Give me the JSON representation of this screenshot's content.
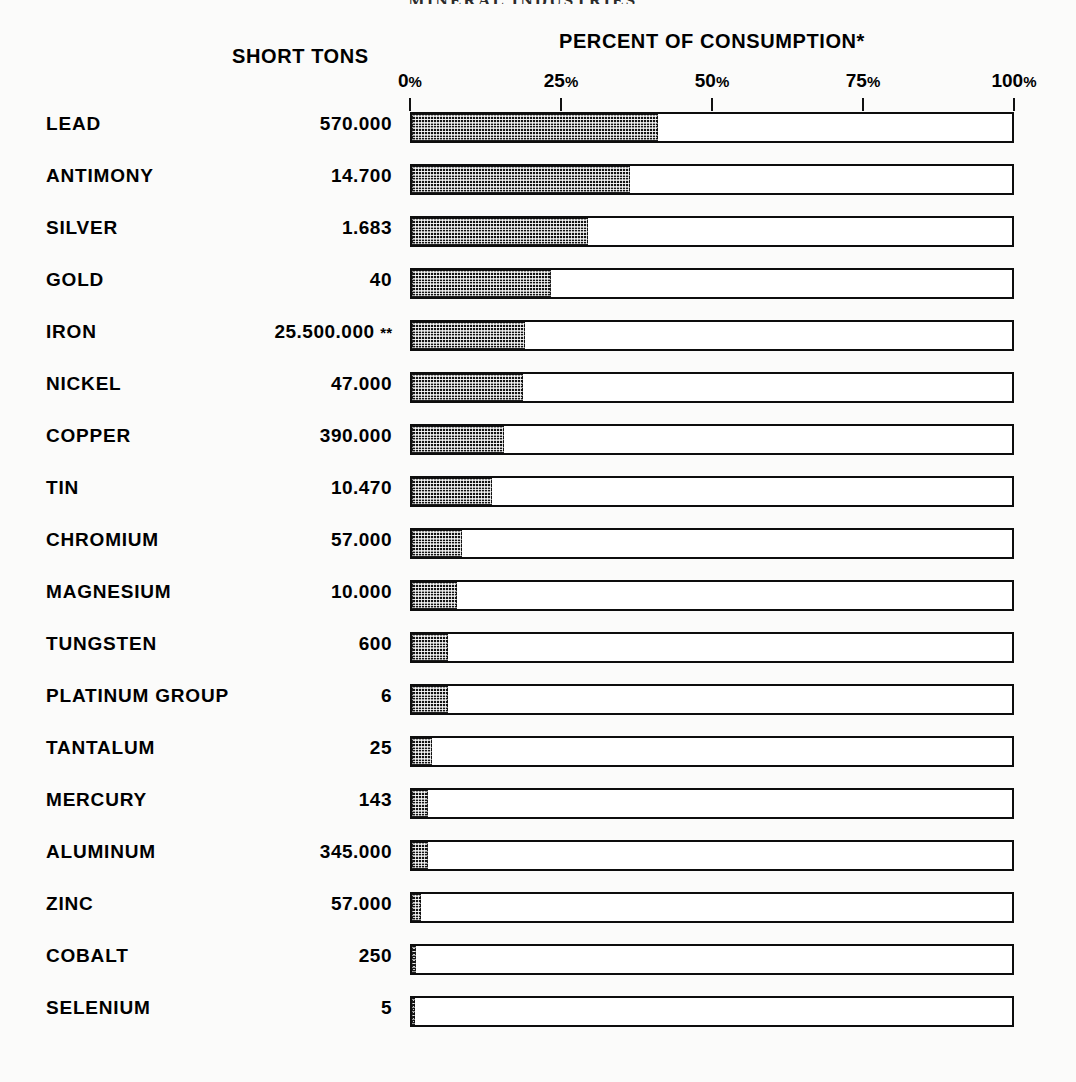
{
  "running_head": "MINERAL INDUSTRIES",
  "headers": {
    "short_tons": "SHORT TONS",
    "percent_of_consumption": "PERCENT OF CONSUMPTION*"
  },
  "colors": {
    "ink": "#0d0d0d",
    "fill": "#141414",
    "paper": "#fbfbfa"
  },
  "chart_data": {
    "type": "bar",
    "orientation": "horizontal",
    "title": "PERCENT OF CONSUMPTION*",
    "xlabel": "",
    "ylabel": "",
    "xlim": [
      0,
      100
    ],
    "grid": false,
    "legend": "none",
    "tick_labels": [
      "0%",
      "25%",
      "50%",
      "75%",
      "100%"
    ],
    "tick_values": [
      0,
      25,
      50,
      75,
      100
    ],
    "value_column_header": "SHORT TONS",
    "categories": [
      "LEAD",
      "ANTIMONY",
      "SILVER",
      "GOLD",
      "IRON",
      "NICKEL",
      "COPPER",
      "TIN",
      "CHROMIUM",
      "MAGNESIUM",
      "TUNGSTEN",
      "PLATINUM  GROUP",
      "TANTALUM",
      "MERCURY",
      "ALUMINUM",
      "ZINC",
      "COBALT",
      "SELENIUM"
    ],
    "short_tons": [
      "570.000",
      "14.700",
      "1.683",
      "40",
      "25.500.000",
      "47.000",
      "390.000",
      "10.470",
      "57.000",
      "10.000",
      "600",
      "6",
      "25",
      "143",
      "345.000",
      "57.000",
      "250",
      "5"
    ],
    "short_tons_note": [
      "",
      "",
      "",
      "",
      "**",
      "",
      "",
      "",
      "",
      "",
      "",
      "",
      "",
      "",
      "",
      "",
      "",
      ""
    ],
    "values": [
      41.0,
      36.4,
      29.3,
      23.2,
      18.9,
      18.5,
      15.4,
      13.4,
      8.3,
      7.5,
      6.0,
      6.0,
      3.3,
      2.6,
      2.6,
      1.5,
      0.7,
      0.5
    ],
    "rows": [
      {
        "label": "LEAD",
        "short_tons": "570.000",
        "note": "",
        "percent": 41.0
      },
      {
        "label": "ANTIMONY",
        "short_tons": "14.700",
        "note": "",
        "percent": 36.4
      },
      {
        "label": "SILVER",
        "short_tons": "1.683",
        "note": "",
        "percent": 29.3
      },
      {
        "label": "GOLD",
        "short_tons": "40",
        "note": "",
        "percent": 23.2
      },
      {
        "label": "IRON",
        "short_tons": "25.500.000",
        "note": "**",
        "percent": 18.9
      },
      {
        "label": "NICKEL",
        "short_tons": "47.000",
        "note": "",
        "percent": 18.5
      },
      {
        "label": "COPPER",
        "short_tons": "390.000",
        "note": "",
        "percent": 15.4
      },
      {
        "label": "TIN",
        "short_tons": "10.470",
        "note": "",
        "percent": 13.4
      },
      {
        "label": "CHROMIUM",
        "short_tons": "57.000",
        "note": "",
        "percent": 8.3
      },
      {
        "label": "MAGNESIUM",
        "short_tons": "10.000",
        "note": "",
        "percent": 7.5
      },
      {
        "label": "TUNGSTEN",
        "short_tons": "600",
        "note": "",
        "percent": 6.0
      },
      {
        "label": "PLATINUM  GROUP",
        "short_tons": "6",
        "note": "",
        "percent": 6.0
      },
      {
        "label": "TANTALUM",
        "short_tons": "25",
        "note": "",
        "percent": 3.3
      },
      {
        "label": "MERCURY",
        "short_tons": "143",
        "note": "",
        "percent": 2.6
      },
      {
        "label": "ALUMINUM",
        "short_tons": "345.000",
        "note": "",
        "percent": 2.6
      },
      {
        "label": "ZINC",
        "short_tons": "57.000",
        "note": "",
        "percent": 1.5
      },
      {
        "label": "COBALT",
        "short_tons": "250",
        "note": "",
        "percent": 0.7
      },
      {
        "label": "SELENIUM",
        "short_tons": "5",
        "note": "",
        "percent": 0.5
      }
    ]
  }
}
